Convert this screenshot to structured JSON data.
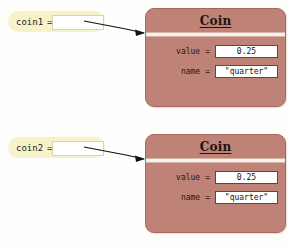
{
  "colors": {
    "page_background": "#fefefc",
    "variable_box": "#f7f2c9",
    "object_box": "#bf8277",
    "object_border": "#a8675c",
    "value_box": "#ffffff",
    "value_border": "#6d4038",
    "text": "#1d1512",
    "arrow": "#14120f"
  },
  "diagrams": [
    {
      "variable": {
        "name": "coin1",
        "equals": "=",
        "slot_value": ""
      },
      "arrow": {
        "icon": "pointer-arrow-icon",
        "points_to": "Coin"
      },
      "object": {
        "title": "Coin",
        "fields": [
          {
            "label": "value",
            "equals": "=",
            "value": "0.25"
          },
          {
            "label": "name",
            "equals": "=",
            "value": "\"quarter\""
          }
        ]
      }
    },
    {
      "variable": {
        "name": "coin2",
        "equals": "=",
        "slot_value": ""
      },
      "arrow": {
        "icon": "pointer-arrow-icon",
        "points_to": "Coin"
      },
      "object": {
        "title": "Coin",
        "fields": [
          {
            "label": "value",
            "equals": "=",
            "value": "0.25"
          },
          {
            "label": "name",
            "equals": "=",
            "value": "\"quarter\""
          }
        ]
      }
    }
  ]
}
